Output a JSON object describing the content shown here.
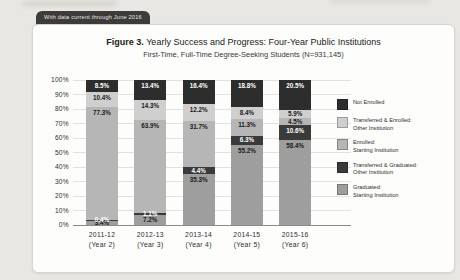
{
  "banner": {
    "label": "With data current through June 2016"
  },
  "figure": {
    "label": "Figure 3.",
    "title_rest": " Yearly Success and Progress: Four-Year Public Institutions",
    "subtitle": "First-Time, Full-Time Degree-Seeking Students (N=931,145)"
  },
  "chart_data": {
    "type": "bar",
    "stacked": true,
    "title": "Figure 3. Yearly Success and Progress: Four-Year Public Institutions",
    "subtitle": "First-Time, Full-Time Degree-Seeking Students (N=931,145)",
    "ylim": [
      0,
      100
    ],
    "y_tick_percents": [
      0,
      10,
      20,
      30,
      40,
      50,
      60,
      70,
      80,
      90,
      100
    ],
    "grid": true,
    "legend_position": "right",
    "categories": [
      {
        "year": "2011-12",
        "cohort_label": "(Year 2)"
      },
      {
        "year": "2012-13",
        "cohort_label": "(Year 3)"
      },
      {
        "year": "2013-14",
        "cohort_label": "(Year 4)"
      },
      {
        "year": "2014-15",
        "cohort_label": "(Year 5)"
      },
      {
        "year": "2015-16",
        "cohort_label": "(Year 6)"
      }
    ],
    "series_bottom_to_top": [
      {
        "name": "Graduated: Starting Institution",
        "legend_lines": [
          "Graduated:",
          "Starting Institution"
        ],
        "color": "#9e9e9e",
        "label_color": "#1a1a1a",
        "values": [
          3.4,
          7.2,
          35.3,
          55.2,
          58.4
        ]
      },
      {
        "name": "Transferred & Graduated: Other Institution",
        "legend_lines": [
          "Transferred & Graduated:",
          "Other Institution"
        ],
        "color": "#3a3a3a",
        "label_color": "#ffffff",
        "values": [
          0.4,
          1.1,
          4.4,
          6.3,
          10.6
        ]
      },
      {
        "name": "Enrolled: Starting Institution",
        "legend_lines": [
          "Enrolled:",
          "Starting Institution"
        ],
        "color": "#b6b6b6",
        "label_color": "#1a1a1a",
        "values": [
          77.3,
          63.9,
          31.7,
          11.3,
          4.5
        ]
      },
      {
        "name": "Transferred & Enrolled: Other Institution",
        "legend_lines": [
          "Transferred & Enrolled:",
          "Other Institution"
        ],
        "color": "#cfcfcf",
        "label_color": "#1a1a1a",
        "values": [
          10.4,
          14.3,
          12.2,
          8.4,
          5.9
        ]
      },
      {
        "name": "Not Enrolled",
        "legend_lines": [
          "Not Enrolled"
        ],
        "color": "#2d2d2d",
        "label_color": "#ffffff",
        "values": [
          8.5,
          13.4,
          16.4,
          18.8,
          20.5
        ]
      }
    ]
  }
}
